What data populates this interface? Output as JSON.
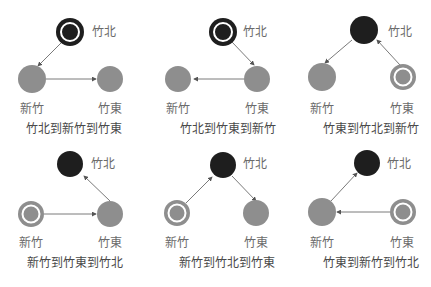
{
  "nodes": {
    "zhubei": "竹北",
    "hsinchu": "新竹",
    "zhudong": "竹東"
  },
  "colors": {
    "dark_node": "#1e1e1e",
    "light_node": "#8e8e8e",
    "ring": "#ffffff",
    "edge": "#7a7a7a",
    "label": "#6b6b6b"
  },
  "panels": [
    {
      "caption": "竹北到新竹到竹東",
      "start": "zhubei",
      "route": [
        "zhubei",
        "hsinchu",
        "zhudong"
      ]
    },
    {
      "caption": "竹北到竹東到新竹",
      "start": "zhubei",
      "route": [
        "zhubei",
        "zhudong",
        "hsinchu"
      ]
    },
    {
      "caption": "竹東到竹北到新竹",
      "start": "zhudong",
      "route": [
        "zhudong",
        "zhubei",
        "hsinchu"
      ]
    },
    {
      "caption": "新竹到竹東到竹北",
      "start": "hsinchu",
      "route": [
        "hsinchu",
        "zhudong",
        "zhubei"
      ]
    },
    {
      "caption": "新竹到竹北到竹東",
      "start": "hsinchu",
      "route": [
        "hsinchu",
        "zhubei",
        "zhudong"
      ]
    },
    {
      "caption": "竹東到新竹到竹北",
      "start": "zhudong",
      "route": [
        "zhudong",
        "hsinchu",
        "zhubei"
      ]
    }
  ]
}
